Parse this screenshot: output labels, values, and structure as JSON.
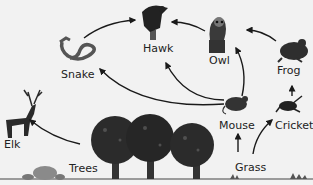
{
  "organisms": {
    "hawk": {
      "label": "Hawk"
    },
    "owl": {
      "label": "Owl"
    },
    "snake": {
      "label": "Snake"
    },
    "frog": {
      "label": "Frog"
    },
    "elk": {
      "label": "Elk"
    },
    "mouse": {
      "label": "Mouse"
    },
    "cricket": {
      "label": "Cricket"
    },
    "trees": {
      "label": "Trees"
    },
    "grass": {
      "label": "Grass"
    }
  },
  "arrows": [
    {
      "from": "Snake",
      "to": "Hawk"
    },
    {
      "from": "Owl",
      "to": "Hawk"
    },
    {
      "from": "Frog",
      "to": "Owl"
    },
    {
      "from": "Mouse",
      "to": "Owl"
    },
    {
      "from": "Mouse",
      "to": "Hawk"
    },
    {
      "from": "Mouse",
      "to": "Snake"
    },
    {
      "from": "Cricket",
      "to": "Frog"
    },
    {
      "from": "Grass",
      "to": "Mouse"
    },
    {
      "from": "Grass",
      "to": "Cricket"
    },
    {
      "from": "Trees",
      "to": "Elk"
    }
  ]
}
